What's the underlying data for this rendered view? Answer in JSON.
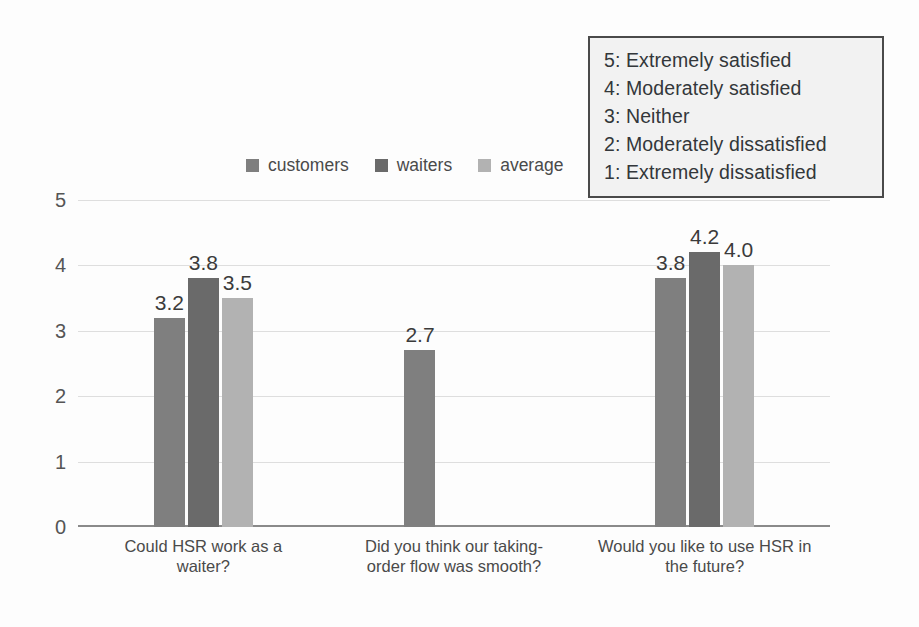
{
  "scale_legend": {
    "name": "satisfaction-scale-legend",
    "items": [
      "5: Extremely satisfied",
      "4: Moderately satisfied",
      "3: Neither",
      "2: Moderately dissatisfied",
      "1: Extremely dissatisfied"
    ]
  },
  "chart_data": {
    "type": "bar",
    "title": "",
    "xlabel": "",
    "ylabel": "",
    "ylim": [
      0,
      5
    ],
    "yticks": [
      0,
      1,
      2,
      3,
      4,
      5
    ],
    "ytick_labels": [
      "0",
      "1",
      "2",
      "3",
      "4",
      "5"
    ],
    "grid": true,
    "legend_position": "top-center",
    "categories": [
      "Could HSR work as a waiter?",
      "Did you think our taking-order flow was smooth?",
      "Would you like to use HSR in the future?"
    ],
    "series": [
      {
        "name": "customers",
        "color": "#7f7f7f",
        "values": [
          3.2,
          2.7,
          3.8
        ],
        "labels": [
          "3.2",
          "2.7",
          "3.8"
        ]
      },
      {
        "name": "waiters",
        "color": "#6a6a6a",
        "values": [
          3.8,
          null,
          4.2
        ],
        "labels": [
          "3.8",
          "",
          "4.2"
        ]
      },
      {
        "name": "average",
        "color": "#b2b2b2",
        "values": [
          3.5,
          null,
          4.0
        ],
        "labels": [
          "3.5",
          "",
          "4.0"
        ]
      }
    ]
  }
}
